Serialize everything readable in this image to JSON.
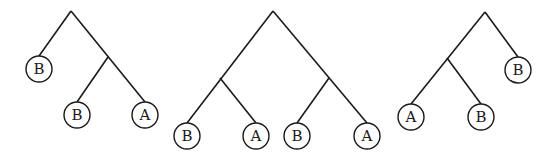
{
  "diagram": {
    "type": "phylogenetic-trees",
    "trees": [
      {
        "name": "tree-1",
        "structure": "(B,(B,A))",
        "leaves": [
          {
            "label": "B",
            "x": 39,
            "y": 69
          },
          {
            "label": "B",
            "x": 77,
            "y": 115
          },
          {
            "label": "A",
            "x": 145,
            "y": 115
          }
        ],
        "edges": [
          [
            71,
            11,
            39,
            56
          ],
          [
            71,
            11,
            145,
            102
          ],
          [
            108,
            57,
            77,
            102
          ]
        ]
      },
      {
        "name": "tree-2",
        "structure": "((B,A),(B,A))",
        "leaves": [
          {
            "label": "B",
            "x": 187,
            "y": 136
          },
          {
            "label": "A",
            "x": 256,
            "y": 136
          },
          {
            "label": "B",
            "x": 297,
            "y": 136
          },
          {
            "label": "A",
            "x": 367,
            "y": 136
          }
        ],
        "edges": [
          [
            273,
            11,
            187,
            123
          ],
          [
            273,
            11,
            367,
            123
          ],
          [
            220,
            78,
            256,
            123
          ],
          [
            329,
            78,
            297,
            123
          ]
        ]
      },
      {
        "name": "tree-3",
        "structure": "((A,B),B)",
        "leaves": [
          {
            "label": "A",
            "x": 411,
            "y": 117
          },
          {
            "label": "B",
            "x": 481,
            "y": 117
          },
          {
            "label": "B",
            "x": 518,
            "y": 70
          }
        ],
        "edges": [
          [
            485,
            12,
            411,
            104
          ],
          [
            485,
            12,
            518,
            57
          ],
          [
            447,
            58,
            481,
            104
          ]
        ]
      }
    ],
    "leaf_radius": 13
  }
}
